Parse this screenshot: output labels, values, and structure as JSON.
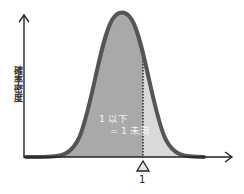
{
  "diagram": {
    "type": "probability-density-curve",
    "y_axis_label": "確率密度",
    "x_marker_label": "1",
    "region_label_line1": "1 以下",
    "region_label_line2": "= 1 未満",
    "colors": {
      "curve_stroke": "#555555",
      "fill_left_of_marker": "#a9a9a9",
      "fill_right_of_marker": "#d9d9d9",
      "axes": "#222222",
      "marker_line": "#333333",
      "region_label_text": "#f4f4f4"
    }
  }
}
